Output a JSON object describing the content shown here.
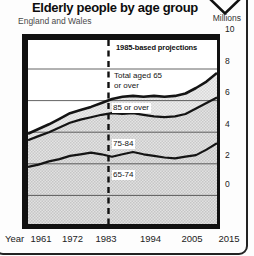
{
  "header": {
    "title": "Elderly people by age group",
    "subtitle": "England and Wales",
    "units_label": "Millions"
  },
  "x_axis_label": "Year",
  "colors": {
    "ink": "#141414",
    "grid": "#3c3c3c",
    "frame": "#111111",
    "dashed_divider": "#101010",
    "hatch_85_a": "#ededed",
    "hatch_85_b": "#d8d8d8",
    "hatch_75_a": "#e4e4e4",
    "hatch_75_b": "#c9c9c9",
    "hatch_65_a": "#e1e1e1",
    "hatch_65_b": "#c6c6c6",
    "card_border": "#222222"
  },
  "chart_data": {
    "type": "area",
    "title": "Elderly people by age group",
    "region_note": "England and Wales",
    "units": "Millions",
    "projection_note": "1985-based projections",
    "projection_divider_year": 1984,
    "xlabel": "Year",
    "ylabel": "Millions",
    "xlim": [
      1961,
      2015
    ],
    "ylim": [
      0,
      11.8
    ],
    "x_ticks": [
      1961,
      1972,
      1983,
      1994,
      2005,
      2015
    ],
    "y_ticks": [
      0,
      2,
      4,
      6,
      8,
      10
    ],
    "grid": "horizontal-only",
    "legend_position": "in-plot-band-labels",
    "x": [
      1961,
      1964,
      1967,
      1970,
      1973,
      1976,
      1979,
      1982,
      1985,
      1988,
      1991,
      1994,
      1997,
      2000,
      2003,
      2006,
      2009,
      2012,
      2015
    ],
    "total_label": "Total aged 65 or over",
    "total_label_lines": [
      "Total aged 65",
      "or over"
    ],
    "bands": [
      {
        "label": "65-74",
        "cumulative_top": [
          3.8,
          3.95,
          4.15,
          4.3,
          4.5,
          4.6,
          4.7,
          4.6,
          4.45,
          4.6,
          4.75,
          4.6,
          4.5,
          4.4,
          4.35,
          4.45,
          4.55,
          4.9,
          5.3
        ]
      },
      {
        "label": "75-84",
        "cumulative_top": [
          5.5,
          5.75,
          6.0,
          6.3,
          6.6,
          6.8,
          6.95,
          7.1,
          7.2,
          7.15,
          7.2,
          7.1,
          7.0,
          6.95,
          7.0,
          7.15,
          7.5,
          7.85,
          8.2
        ]
      },
      {
        "label": "85 or over",
        "cumulative_top": [
          5.9,
          6.2,
          6.5,
          6.85,
          7.2,
          7.4,
          7.6,
          7.85,
          8.1,
          8.25,
          8.3,
          8.25,
          8.3,
          8.25,
          8.3,
          8.45,
          8.8,
          9.2,
          9.75
        ]
      }
    ]
  }
}
